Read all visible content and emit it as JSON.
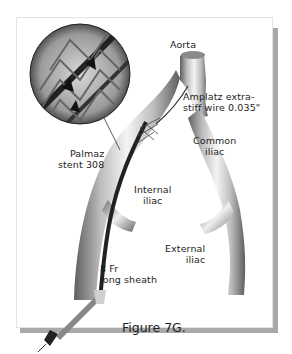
{
  "figure": {
    "caption": "Figure 7G.",
    "labels": {
      "aorta": "Aorta",
      "wire_line1": "Amplatz extra-",
      "wire_line2": "stiff wire 0.035\"",
      "common_iliac_line1": "Common",
      "common_iliac_line2": "iliac",
      "stent_line1": "Palmaz",
      "stent_line2": "stent 308",
      "internal_iliac_line1": "Internal",
      "internal_iliac_line2": "iliac",
      "external_iliac_line1": "External",
      "external_iliac_line2": "iliac",
      "sheath_line1": "8 Fr",
      "sheath_line2": "long sheath"
    },
    "colors": {
      "vessel_dark": "#6a6a6a",
      "vessel_light": "#f2f2f2",
      "sheath": "#2a2a2a",
      "frame_shadow": "#a9a9a9"
    }
  }
}
